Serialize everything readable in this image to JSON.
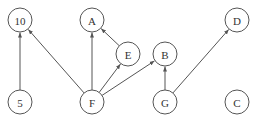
{
  "diagram": {
    "type": "directed-graph",
    "nodes": [
      {
        "id": "10",
        "label": "10",
        "x": 20,
        "y": 20
      },
      {
        "id": "A",
        "label": "A",
        "x": 92,
        "y": 20
      },
      {
        "id": "D",
        "label": "D",
        "x": 237,
        "y": 20
      },
      {
        "id": "E",
        "label": "E",
        "x": 128,
        "y": 54
      },
      {
        "id": "B",
        "label": "B",
        "x": 165,
        "y": 54
      },
      {
        "id": "5",
        "label": "5",
        "x": 20,
        "y": 102
      },
      {
        "id": "F",
        "label": "F",
        "x": 92,
        "y": 102
      },
      {
        "id": "G",
        "label": "G",
        "x": 165,
        "y": 102
      },
      {
        "id": "C",
        "label": "C",
        "x": 237,
        "y": 102
      }
    ],
    "edges": [
      {
        "from": "5",
        "to": "10"
      },
      {
        "from": "F",
        "to": "10"
      },
      {
        "from": "F",
        "to": "A"
      },
      {
        "from": "F",
        "to": "E"
      },
      {
        "from": "E",
        "to": "A"
      },
      {
        "from": "F",
        "to": "B"
      },
      {
        "from": "G",
        "to": "B"
      },
      {
        "from": "G",
        "to": "D"
      }
    ],
    "node_radius": 12
  }
}
